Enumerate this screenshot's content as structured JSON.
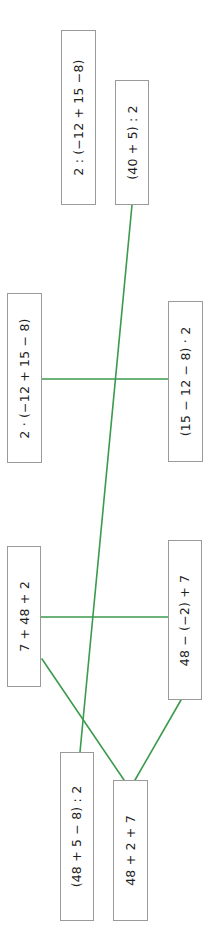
{
  "diagram": {
    "type": "matching-expressions",
    "line_color": "#3b9a4c",
    "box_border_color": "#9a9a9a",
    "text_color": "#1e1e1e",
    "boxes": [
      {
        "id": "b1",
        "label": "2 : (−12 + 15 −8)"
      },
      {
        "id": "b2",
        "label": "(40 + 5) : 2"
      },
      {
        "id": "b3",
        "label": "2 · (−12 + 15 − 8)"
      },
      {
        "id": "b4",
        "label": "(15 − 12 − 8) · 2"
      },
      {
        "id": "b5",
        "label": "7 + 48 + 2"
      },
      {
        "id": "b6",
        "label": "48 − (−2) + 7"
      },
      {
        "id": "b7",
        "label": "(48 + 5 − 8) : 2"
      },
      {
        "id": "b8",
        "label": "48 + 2 + 7"
      }
    ],
    "connections": [
      {
        "from": "b2",
        "to": "b7"
      },
      {
        "from": "b3",
        "to": "b4"
      },
      {
        "from": "b5",
        "to": "b6"
      },
      {
        "from": "b5",
        "to": "b8"
      },
      {
        "from": "b6",
        "to": "b8"
      }
    ]
  }
}
